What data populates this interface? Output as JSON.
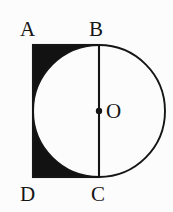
{
  "figure": {
    "kind": "plane-geometry-diagram",
    "width": 173,
    "height": 212,
    "background_color": "#fcfcfc",
    "stroke_color": "#151515",
    "shaded_fill_color": "#121212",
    "unshaded_fill_color": "#fcfcfc",
    "labels": {
      "a": "A",
      "b": "B",
      "c": "C",
      "d": "D",
      "o": "O"
    },
    "geometry": {
      "circle": {
        "center_x": 99,
        "center_y": 111,
        "radius": 66
      },
      "rectangle": {
        "x": 33,
        "y": 45,
        "width": 66,
        "height": 132
      },
      "diameter_line": {
        "x1": 99,
        "y1": 45,
        "x2": 99,
        "y2": 177
      },
      "center_dot_radius": 3.2
    }
  }
}
